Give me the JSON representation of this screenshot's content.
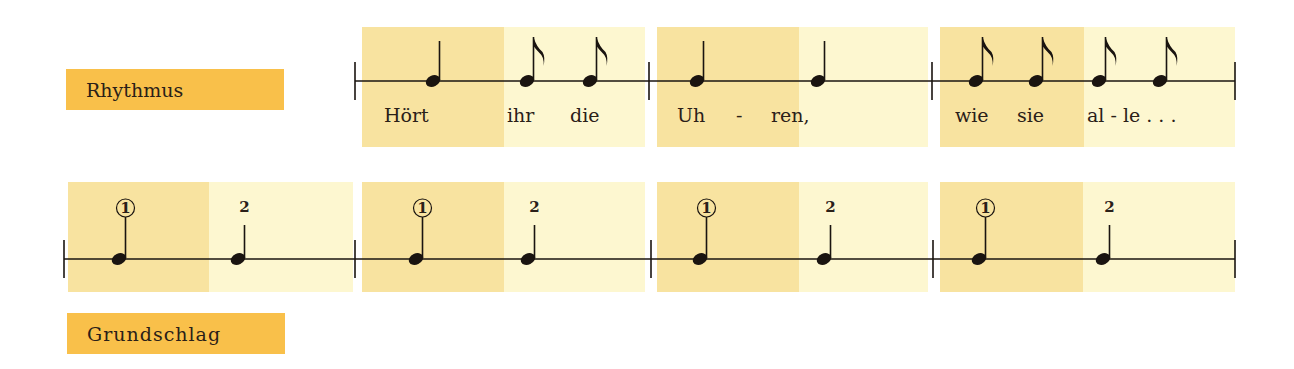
{
  "labels": {
    "rhythm": "Rhythmus",
    "beat": "Grundschlag"
  },
  "colors": {
    "label_bg": "#f9c04a",
    "strong_half": "#f8e3a0",
    "weak_half": "#fdf7d0",
    "ink": "#1a1410"
  },
  "rhythm_row": {
    "staff_y": 81,
    "barlines_x": [
      355,
      649,
      932,
      1235
    ],
    "measures": [
      {
        "box": [
          362,
          645
        ],
        "split": 504,
        "notes": [
          {
            "x": 433,
            "type": "quarter"
          },
          {
            "x": 527,
            "type": "eighth"
          },
          {
            "x": 590,
            "type": "eighth"
          }
        ],
        "lyrics": [
          {
            "x": 384,
            "text": "Hört"
          },
          {
            "x": 507,
            "text": "ihr"
          },
          {
            "x": 570,
            "text": "die"
          }
        ]
      },
      {
        "box": [
          657,
          928
        ],
        "split": 799,
        "notes": [
          {
            "x": 697,
            "type": "quarter"
          },
          {
            "x": 818,
            "type": "quarter"
          }
        ],
        "lyrics": [
          {
            "x": 677,
            "text": "Uh"
          },
          {
            "x": 736,
            "text": "-"
          },
          {
            "x": 771,
            "text": "ren,"
          }
        ]
      },
      {
        "box": [
          940,
          1235
        ],
        "split": 1084,
        "notes": [
          {
            "x": 976,
            "type": "eighth"
          },
          {
            "x": 1036,
            "type": "eighth"
          },
          {
            "x": 1099,
            "type": "eighth"
          },
          {
            "x": 1160,
            "type": "eighth"
          }
        ],
        "lyrics": [
          {
            "x": 955,
            "text": "wie"
          },
          {
            "x": 1017,
            "text": "sie"
          },
          {
            "x": 1087,
            "text": "al - le . . ."
          }
        ]
      }
    ]
  },
  "beat_row": {
    "staff_y": 259,
    "barlines_x": [
      64,
      355,
      651,
      933,
      1235
    ],
    "measures": [
      {
        "box": [
          68,
          353
        ],
        "split": 209,
        "notes": [
          {
            "x": 119,
            "beat": "1",
            "accent": true
          },
          {
            "x": 238,
            "beat": "2",
            "accent": false
          }
        ]
      },
      {
        "box": [
          362,
          645
        ],
        "split": 504,
        "notes": [
          {
            "x": 416,
            "beat": "1",
            "accent": true
          },
          {
            "x": 528,
            "beat": "2",
            "accent": false
          }
        ]
      },
      {
        "box": [
          657,
          928
        ],
        "split": 799,
        "notes": [
          {
            "x": 700,
            "beat": "1",
            "accent": true
          },
          {
            "x": 824,
            "beat": "2",
            "accent": false
          }
        ]
      },
      {
        "box": [
          940,
          1235
        ],
        "split": 1083,
        "notes": [
          {
            "x": 979,
            "beat": "1",
            "accent": true
          },
          {
            "x": 1103,
            "beat": "2",
            "accent": false
          }
        ]
      }
    ]
  }
}
